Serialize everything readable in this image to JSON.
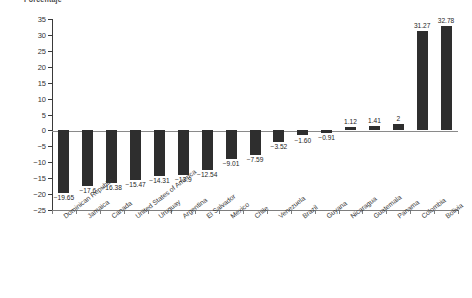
{
  "chart_data": {
    "type": "bar",
    "title": "Porcentaje",
    "xlabel": "",
    "ylabel": "",
    "ylim": [
      -25,
      35
    ],
    "ytick_labels": [
      "35",
      "30",
      "25",
      "20",
      "15",
      "10",
      "5",
      "0",
      "-5",
      "-10",
      "-15",
      "-20",
      "-25"
    ],
    "ytick_values": [
      35,
      30,
      25,
      20,
      15,
      10,
      5,
      0,
      -5,
      -10,
      -15,
      -20,
      -25
    ],
    "grid": false,
    "legend": false,
    "bar_color": "#2e2e2e",
    "categories": [
      "Dominican Republic",
      "Jamaica",
      "Canada",
      "United States of America",
      "Uruguay",
      "Argentina",
      "El Salvador",
      "Mexico",
      "Chile",
      "Venezuela",
      "Brazil",
      "Guyana",
      "Nicaragua",
      "Guatemala",
      "Panama",
      "Colombia",
      "Bolivia"
    ],
    "values": [
      -19.65,
      -17.6,
      -16.38,
      -15.47,
      -14.31,
      -13.9,
      -12.54,
      -9.01,
      -7.59,
      -3.52,
      -1.6,
      -0.91,
      1.12,
      1.41,
      2,
      31.27,
      32.78
    ],
    "value_labels": [
      "-19.65",
      "-17.6",
      "-16.38",
      "-15.47",
      "-14.31",
      "-13.9",
      "-12.54",
      "-9.01",
      "-7.59",
      "-3.52",
      "-1.60",
      "-0.91",
      "1.12",
      "1.41",
      "2",
      "31.27",
      "32.78"
    ]
  }
}
